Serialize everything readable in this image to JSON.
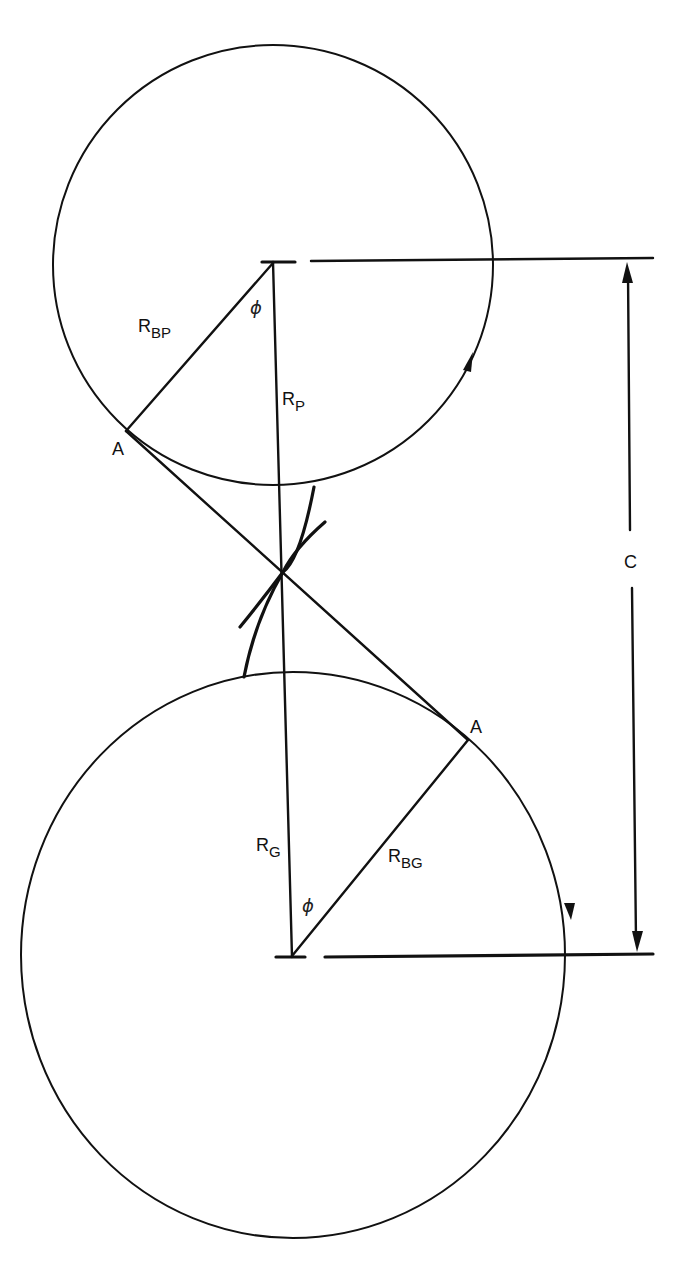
{
  "diagram": {
    "type": "gear-mesh-geometry",
    "pinion": {
      "name": "pinion",
      "center": [
        273,
        263
      ],
      "radius": 222,
      "rotation_arrow": "counterclockwise"
    },
    "gear": {
      "name": "gear",
      "center": [
        292,
        957
      ],
      "radius_x": 272,
      "radius_y": 283,
      "rotation_arrow": "clockwise"
    },
    "pitch_point": [
      283,
      572
    ],
    "labels": {
      "pinion_pitch_radius": {
        "main": "R",
        "sub": "P"
      },
      "pinion_base_radius": {
        "main": "R",
        "sub": "BP"
      },
      "gear_pitch_radius": {
        "main": "R",
        "sub": "G"
      },
      "gear_base_radius": {
        "main": "R",
        "sub": "BG"
      },
      "pressure_angle_top": "ϕ",
      "pressure_angle_bottom": "ϕ",
      "contact_point_top": "A",
      "contact_point_bottom": "A",
      "center_distance": "C"
    },
    "colors": {
      "line": "#111111",
      "background": "#ffffff"
    }
  }
}
